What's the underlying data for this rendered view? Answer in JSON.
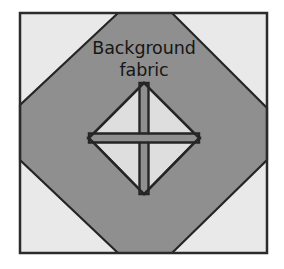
{
  "figure": {
    "name": "quilt-block-diagram",
    "width": 284,
    "height": 269,
    "page_background": "#ffffff"
  },
  "block": {
    "frame": {
      "x": 20,
      "y": 13,
      "width": 247,
      "height": 240,
      "border_color": "#2b2b2b",
      "border_width": 2.5
    },
    "background_fabric": {
      "label": "Background",
      "color": "#e9e9e9",
      "description": "light corner triangles"
    },
    "feature_fabric": {
      "color": "#8f8f8f",
      "description": "medium gray octagon / on-point square"
    },
    "center_fabric": {
      "color": "#dedede",
      "description": "light quarter-square triangle unit"
    },
    "seam_color": "#252525"
  },
  "annotation": {
    "line1": "Background",
    "line2": "fabric",
    "color": "#161616",
    "x": 144,
    "line1_y": 54,
    "line2_y": 76
  },
  "geometry": {
    "octagon_points": "118,13 172,13 267,108 267,160 172,253 118,253 20,160 20,105",
    "inner_diamond": {
      "top": [
        144,
        83
      ],
      "right": [
        199,
        138
      ],
      "bottom": [
        144,
        194
      ],
      "left": [
        89,
        138
      ]
    },
    "cross_center": [
      144,
      138
    ],
    "cross_half_width": 4.5
  }
}
